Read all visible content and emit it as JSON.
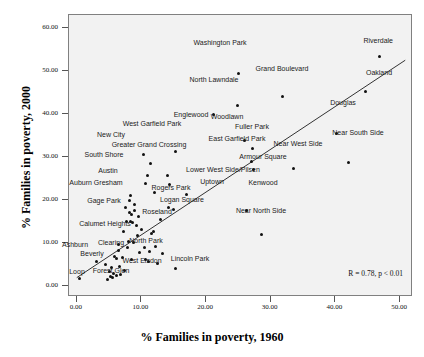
{
  "chart_data": {
    "type": "scatter",
    "title": "",
    "xlabel": "% Families in poverty, 1960",
    "ylabel": "% Families in poverty, 2000",
    "xlim": [
      -1.2,
      52.0
    ],
    "ylim": [
      -2.5,
      63.0
    ],
    "xticks": [
      "0.00",
      "10.00",
      "20.00",
      "30.00",
      "40.00",
      "50.00"
    ],
    "xtick_values": [
      0,
      10,
      20,
      30,
      40,
      50
    ],
    "yticks": [
      "0.00",
      "10.00",
      "20.00",
      "30.00",
      "40.00",
      "50.00",
      "60.00"
    ],
    "ytick_values": [
      0,
      10,
      20,
      30,
      40,
      50,
      60
    ],
    "grid": false,
    "legend": "none",
    "panel_background": "#f2f2f2",
    "marker_color": "#111111",
    "line_color": "#333333",
    "annotation": "R = 0.78, p < 0.01",
    "fit_line": {
      "x1": 0.0,
      "y1": 2.0,
      "x2": 50.8,
      "y2": 52.5
    },
    "points": [
      {
        "label": "Riverdale",
        "x": 46.8,
        "y": 53.4,
        "lx": 392,
        "ly": 36,
        "anchor": "end"
      },
      {
        "label": "Washington Park",
        "x": 25.0,
        "y": 49.4,
        "lx": 219,
        "ly": 38,
        "anchor": "center"
      },
      {
        "label": "Oakland",
        "x": 44.7,
        "y": 45.2,
        "lx": 378,
        "ly": 68,
        "anchor": "center"
      },
      {
        "label": "Grand Boulevard",
        "x": 31.8,
        "y": 44.1,
        "lx": 281,
        "ly": 64,
        "anchor": "center"
      },
      {
        "label": "North Lawndale",
        "x": 24.8,
        "y": 42.0,
        "lx": 213,
        "ly": 75,
        "anchor": "center"
      },
      {
        "label": "Englewood",
        "x": 21.2,
        "y": 40.0,
        "lx": 190,
        "ly": 110,
        "anchor": "center"
      },
      {
        "label": "Douglas",
        "x": 40.1,
        "y": 35.5,
        "lx": 342,
        "ly": 98,
        "anchor": "center"
      },
      {
        "label": "Woodlawn",
        "x": 25.9,
        "y": 33.9,
        "lx": 226,
        "ly": 112,
        "anchor": "center"
      },
      {
        "label": "Fuller Park",
        "x": 27.2,
        "y": 31.9,
        "lx": 251,
        "ly": 122,
        "anchor": "center"
      },
      {
        "label": "West Garfield Park",
        "x": 15.3,
        "y": 31.3,
        "lx": 151,
        "ly": 119,
        "anchor": "center"
      },
      {
        "label": "New City",
        "x": 10.3,
        "y": 30.6,
        "lx": 110,
        "ly": 130,
        "anchor": "center"
      },
      {
        "label": "East Garfield Park",
        "x": 27.0,
        "y": 28.9,
        "lx": 236,
        "ly": 134,
        "anchor": "center"
      },
      {
        "label": "Near South Side",
        "x": 42.1,
        "y": 28.8,
        "lx": 357,
        "ly": 128,
        "anchor": "center"
      },
      {
        "label": "Greater Grand Crossing",
        "x": 11.4,
        "y": 28.4,
        "lx": 148,
        "ly": 140,
        "anchor": "center"
      },
      {
        "label": "Near West Side",
        "x": 33.5,
        "y": 27.4,
        "lx": 297,
        "ly": 139,
        "anchor": "center"
      },
      {
        "label": "Armour Square",
        "x": 27.4,
        "y": 27.2,
        "lx": 262,
        "ly": 152,
        "anchor": "center"
      },
      {
        "label": "South Shore",
        "x": 10.9,
        "y": 25.7,
        "lx": 103,
        "ly": 150,
        "anchor": "center"
      },
      {
        "label": "",
        "x": 14.1,
        "y": 25.7
      },
      {
        "label": "",
        "x": 10.7,
        "y": 23.8
      },
      {
        "label": "Lower West Side/Pilsen",
        "x": 14.4,
        "y": 23.7,
        "lx": 222,
        "ly": 165,
        "anchor": "center"
      },
      {
        "label": "Austin",
        "x": 12.0,
        "y": 21.8,
        "lx": 107,
        "ly": 166,
        "anchor": "center"
      },
      {
        "label": "",
        "x": 8.3,
        "y": 21.0
      },
      {
        "label": "Uptown",
        "x": 16.9,
        "y": 21.3,
        "lx": 211,
        "ly": 177,
        "anchor": "center"
      },
      {
        "label": "Auburn Gresham",
        "x": 8.1,
        "y": 19.9,
        "lx": 95,
        "ly": 178,
        "anchor": "center"
      },
      {
        "label": "Rogers Park",
        "x": 14.2,
        "y": 18.3,
        "lx": 170,
        "ly": 183,
        "anchor": "center"
      },
      {
        "label": "Kenwood",
        "x": 26.3,
        "y": 17.6,
        "lx": 262,
        "ly": 178,
        "anchor": "center"
      },
      {
        "label": "",
        "x": 9.0,
        "y": 17.6
      },
      {
        "label": "",
        "x": 8.1,
        "y": 17.1
      },
      {
        "label": "",
        "x": 8.4,
        "y": 16.6
      },
      {
        "label": "Logan Square",
        "x": 15.0,
        "y": 17.9,
        "lx": 181,
        "ly": 195,
        "anchor": "center"
      },
      {
        "label": "Gage Park",
        "x": 7.7,
        "y": 15.1,
        "lx": 103,
        "ly": 196,
        "anchor": "center"
      },
      {
        "label": "",
        "x": 8.3,
        "y": 15.1
      },
      {
        "label": "",
        "x": 8.6,
        "y": 14.8
      },
      {
        "label": "Roseland",
        "x": 11.9,
        "y": 12.8,
        "lx": 156,
        "ly": 207,
        "anchor": "center"
      },
      {
        "label": "",
        "x": 11.6,
        "y": 12.2
      },
      {
        "label": "Calumet Heights",
        "x": 8.0,
        "y": 10.4,
        "lx": 104,
        "ly": 219,
        "anchor": "center"
      },
      {
        "label": "",
        "x": 8.7,
        "y": 10.2
      },
      {
        "label": "",
        "x": 6.4,
        "y": 9.6
      },
      {
        "label": "",
        "x": 12.2,
        "y": 9.3
      },
      {
        "label": "",
        "x": 7.9,
        "y": 8.9
      },
      {
        "label": "",
        "x": 6.4,
        "y": 8.4
      },
      {
        "label": "North Park",
        "x": 9.7,
        "y": 7.8,
        "lx": 145,
        "ly": 236,
        "anchor": "center"
      },
      {
        "label": "",
        "x": 13.2,
        "y": 7.7
      },
      {
        "label": "",
        "x": 5.8,
        "y": 7.0
      },
      {
        "label": "Clearing",
        "x": 6.1,
        "y": 6.4,
        "lx": 110,
        "ly": 238,
        "anchor": "center"
      },
      {
        "label": "Ashburn",
        "x": 3.0,
        "y": 5.7,
        "lx": 74,
        "ly": 240,
        "anchor": "center"
      },
      {
        "label": "",
        "x": 10.7,
        "y": 6.1
      },
      {
        "label": "",
        "x": 11.1,
        "y": 5.8
      },
      {
        "label": "",
        "x": 12.5,
        "y": 5.2
      },
      {
        "label": "",
        "x": 6.6,
        "y": 4.7
      },
      {
        "label": "",
        "x": 5.4,
        "y": 4.4
      },
      {
        "label": "Lincoln Park",
        "x": 15.3,
        "y": 4.1,
        "lx": 189,
        "ly": 254,
        "anchor": "center"
      },
      {
        "label": "Beverly",
        "x": 5.0,
        "y": 3.4,
        "lx": 91,
        "ly": 249,
        "anchor": "center"
      },
      {
        "label": "",
        "x": 5.7,
        "y": 3.0
      },
      {
        "label": "West Elsdon",
        "x": 6.8,
        "y": 2.8,
        "lx": 141,
        "ly": 256,
        "anchor": "center"
      },
      {
        "label": "",
        "x": 5.2,
        "y": 2.3
      },
      {
        "label": "",
        "x": 5.6,
        "y": 2.1
      },
      {
        "label": "Forest Glen",
        "x": 4.8,
        "y": 1.6,
        "lx": 110,
        "ly": 266,
        "anchor": "center"
      },
      {
        "label": "Loop",
        "x": 0.4,
        "y": 1.7,
        "lx": 76,
        "ly": 267,
        "anchor": "center"
      },
      {
        "label": "Near North Side",
        "x": 28.5,
        "y": 12.0,
        "lx": 260,
        "ly": 206,
        "anchor": "center"
      },
      {
        "label": "",
        "x": 9.5,
        "y": 16.2
      },
      {
        "label": "",
        "x": 9.2,
        "y": 14.0
      },
      {
        "label": "",
        "x": 10.0,
        "y": 13.1
      },
      {
        "label": "",
        "x": 9.4,
        "y": 11.8
      },
      {
        "label": "",
        "x": 7.2,
        "y": 12.6
      },
      {
        "label": "",
        "x": 10.5,
        "y": 9.0
      },
      {
        "label": "",
        "x": 11.2,
        "y": 8.0
      },
      {
        "label": "",
        "x": 7.0,
        "y": 6.6
      },
      {
        "label": "",
        "x": 8.5,
        "y": 6.3
      },
      {
        "label": "",
        "x": 7.4,
        "y": 3.6
      },
      {
        "label": "",
        "x": 6.2,
        "y": 2.4
      },
      {
        "label": "",
        "x": 4.5,
        "y": 5.1
      },
      {
        "label": "",
        "x": 13.0,
        "y": 15.4
      },
      {
        "label": "",
        "x": 8.9,
        "y": 19.0
      },
      {
        "label": "",
        "x": 7.6,
        "y": 18.2
      }
    ]
  }
}
